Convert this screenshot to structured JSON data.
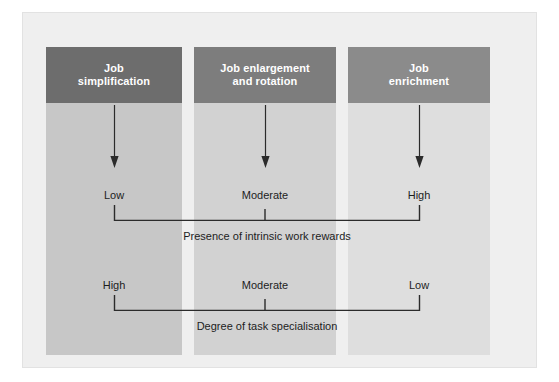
{
  "diagram": {
    "frame": {
      "background_color": "#efefef",
      "border_color": "#e2e2e2"
    },
    "columns": [
      {
        "id": "job-simplification",
        "header_label": "Job\nsimplification",
        "header_line_1": "Job",
        "header_line_2": "simplification",
        "header_color": "#6d6d6d",
        "band_color": "#c7c7c7",
        "arrow_icon": "down-arrow-icon",
        "intrinsic_rewards": "Low",
        "task_specialisation": "High"
      },
      {
        "id": "job-enlargement-and-rotation",
        "header_label": "Job enlargement\nand rotation",
        "header_line_1": "Job enlargement",
        "header_line_2": "and rotation",
        "header_color": "#7d7d7d",
        "band_color": "#d2d2d2",
        "arrow_icon": "down-arrow-icon",
        "intrinsic_rewards": "Moderate",
        "task_specialisation": "Moderate"
      },
      {
        "id": "job-enrichment",
        "header_label": "Job\nenrichment",
        "header_line_1": "Job",
        "header_line_2": "enrichment",
        "header_color": "#8b8b8b",
        "band_color": "#dedede",
        "arrow_icon": "down-arrow-icon",
        "intrinsic_rewards": "High",
        "task_specialisation": "Low"
      }
    ],
    "rows": [
      {
        "id": "presence-of-intrinsic-work-rewards",
        "caption": "Presence of intrinsic work rewards",
        "values": [
          "Low",
          "Moderate",
          "High"
        ]
      },
      {
        "id": "degree-of-task-specialisation",
        "caption": "Degree of task specialisation",
        "values": [
          "High",
          "Moderate",
          "Low"
        ]
      }
    ],
    "line_color": "#2b2b2b",
    "text_color": "#1d1d1d",
    "header_text_color": "#ffffff"
  }
}
